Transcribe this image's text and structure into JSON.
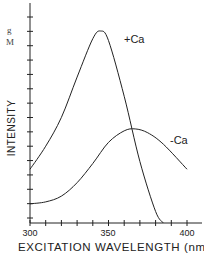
{
  "chart_data": {
    "type": "line",
    "title": "",
    "xlabel": "EXCITATION WAVELENGTH (nm)",
    "ylabel": "INTENSITY",
    "xlim": [
      300,
      410
    ],
    "ylim": [
      0,
      1
    ],
    "x_ticks": [
      300,
      350,
      400
    ],
    "x_minor_step": 10,
    "y_tick_count": 15,
    "grid": false,
    "legend": "inline labels",
    "top_left_fragment": [
      "g",
      "M"
    ],
    "series": [
      {
        "name": "+Ca",
        "label": "+Ca",
        "x": [
          300,
          310,
          320,
          330,
          340,
          345,
          350,
          360,
          370,
          380,
          385
        ],
        "y": [
          0.28,
          0.4,
          0.55,
          0.76,
          0.96,
          1.0,
          0.95,
          0.66,
          0.32,
          0.06,
          0.0
        ]
      },
      {
        "name": "-Ca",
        "label": "-Ca",
        "x": [
          300,
          310,
          320,
          330,
          340,
          350,
          360,
          367,
          375,
          385,
          400
        ],
        "y": [
          0.1,
          0.11,
          0.14,
          0.21,
          0.31,
          0.42,
          0.48,
          0.49,
          0.47,
          0.41,
          0.28
        ]
      }
    ]
  }
}
